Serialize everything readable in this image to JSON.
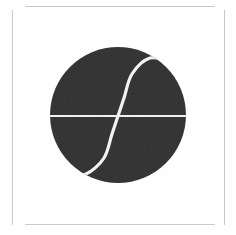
{
  "canvas": {
    "width": 236,
    "height": 235,
    "background_color": "#fefefe"
  },
  "frame": {
    "name": "thin-border-frame",
    "color": "#c9c9c9",
    "left_line": {
      "x": 12,
      "y": 10,
      "height": 215
    },
    "right_line": {
      "x": 224,
      "y": 10,
      "height": 215
    },
    "top_line": {
      "x": 25,
      "y": 6,
      "width": 190
    },
    "bottom_line": {
      "x": 25,
      "y": 224,
      "width": 190
    }
  },
  "logo": {
    "name": "integral-sigmoid-circle-logo",
    "description": "Dark textured circle containing a white horizontal axis line and a white sigmoid (integral-sign) curve",
    "circle": {
      "center_x": 118,
      "center_y": 115,
      "radius": 68,
      "fill_color": "#393939",
      "texture": "noise-grain"
    },
    "axis_line": {
      "name": "horizontal-axis-line",
      "color": "#f0f0f0",
      "y": 116,
      "x_start": 50,
      "x_end": 187,
      "stroke_width": 2
    },
    "curve": {
      "name": "sigmoid-curve",
      "color": "#f2f2f2",
      "stroke_width": 3.2,
      "start_point": [
        172,
        62
      ],
      "end_point": [
        70,
        172
      ],
      "control_points": [
        [
          150,
          58
        ],
        [
          132,
          74
        ],
        [
          124,
          98
        ],
        [
          118,
          116
        ],
        [
          112,
          134
        ],
        [
          104,
          158
        ],
        [
          86,
          174
        ]
      ]
    }
  }
}
